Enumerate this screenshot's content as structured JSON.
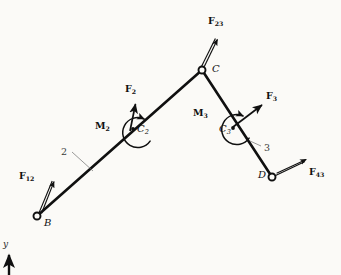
{
  "figure": {
    "background_color": "#fbfaf7",
    "ink_color": "#101010",
    "width": 341,
    "height": 275
  },
  "joints": [
    {
      "id": "B",
      "label": "B",
      "x": 37,
      "y": 216,
      "type": "pin"
    },
    {
      "id": "C",
      "label": "C",
      "x": 202,
      "y": 70,
      "type": "pin"
    },
    {
      "id": "D",
      "label": "D",
      "x": 272,
      "y": 177,
      "type": "pin"
    }
  ],
  "links": [
    {
      "id": "2",
      "label": "2",
      "from": "B",
      "to": "C",
      "label_x": 62,
      "label_y": 152
    },
    {
      "id": "3",
      "label": "3",
      "from": "C",
      "to": "D",
      "label_x": 263,
      "label_y": 148
    }
  ],
  "centers": [
    {
      "id": "C2",
      "label": "C",
      "sub": "2",
      "x": 133,
      "y": 129,
      "label_x": 137,
      "label_y": 130
    },
    {
      "id": "C3",
      "label": "C",
      "sub": "3",
      "x": 233,
      "y": 128,
      "label_x": 220,
      "label_y": 130
    }
  ],
  "forces": [
    {
      "id": "F12",
      "label": "F",
      "sub": "12",
      "tail_x": 40,
      "tail_y": 212,
      "tip_x": 53,
      "tip_y": 180,
      "label_x": 22,
      "label_y": 176,
      "style": "double"
    },
    {
      "id": "F2",
      "label": "F",
      "sub": "2",
      "tail_x": 130,
      "tail_y": 131,
      "tip_x": 135,
      "tip_y": 103,
      "label_x": 126,
      "label_y": 88,
      "style": "single"
    },
    {
      "id": "F23",
      "label": "F",
      "sub": "23",
      "tail_x": 203,
      "tail_y": 66,
      "tip_x": 217,
      "tip_y": 37,
      "label_x": 210,
      "label_y": 20,
      "style": "double"
    },
    {
      "id": "F3",
      "label": "F",
      "sub": "3",
      "tail_x": 233,
      "tail_y": 127,
      "tip_x": 263,
      "tip_y": 104,
      "label_x": 267,
      "label_y": 95,
      "style": "single"
    },
    {
      "id": "F43",
      "label": "F",
      "sub": "43",
      "tail_x": 276,
      "tail_y": 174,
      "tip_x": 307,
      "tip_y": 160,
      "label_x": 310,
      "label_y": 172,
      "style": "double"
    }
  ],
  "moments": [
    {
      "id": "M2",
      "label": "M",
      "sub": "2",
      "center_x": 137,
      "center_y": 133,
      "radius": 15,
      "label_x": 96,
      "label_y": 126,
      "arrow_x": 120,
      "arrow_y": 129,
      "direction": "counterclockwise"
    },
    {
      "id": "M3",
      "label": "M",
      "sub": "3",
      "center_x": 236,
      "center_y": 130,
      "radius": 15,
      "label_x": 194,
      "label_y": 113,
      "arrow_x": 219,
      "arrow_y": 127,
      "direction": "counterclockwise"
    }
  ],
  "axis": {
    "label": "y",
    "label_x": 3,
    "label_y": 243,
    "tail_x": 9,
    "tail_y": 275,
    "tip_x": 9,
    "tip_y": 254
  }
}
